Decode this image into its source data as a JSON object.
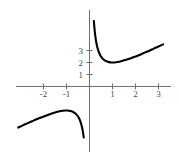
{
  "chart_data": {
    "type": "line",
    "title": "",
    "subtitle": "",
    "xlabel": "",
    "ylabel": "",
    "xlim": [
      -3.3,
      3.4
    ],
    "ylim": [
      -3.6,
      5.6
    ],
    "grid": false,
    "legend": null,
    "function": "y = x + 1/x",
    "x_ticks": [
      -2,
      -1,
      1,
      2,
      3
    ],
    "x_tick_labels": [
      "-2",
      "-1",
      "1",
      "2",
      "3"
    ],
    "y_ticks": [
      1,
      2,
      3
    ],
    "y_tick_labels": [
      "1",
      "2",
      "3"
    ],
    "annotations": [],
    "series": [
      {
        "name": "right-branch",
        "comment": "x > 0 branch, vertical asymptote at x=0, minimum at (1,2)",
        "x": [
          0.19,
          0.21,
          0.24,
          0.27,
          0.3,
          0.34,
          0.38,
          0.43,
          0.48,
          0.54,
          0.6,
          0.68,
          0.76,
          0.85,
          0.95,
          1.05,
          1.15,
          1.3,
          1.45,
          1.6,
          1.8,
          2.0,
          2.2,
          2.4,
          2.6,
          2.8,
          3.0,
          3.2
        ],
        "y": [
          5.45,
          4.97,
          4.41,
          3.97,
          3.63,
          3.28,
          3.01,
          2.76,
          2.56,
          2.39,
          2.27,
          2.15,
          2.08,
          2.03,
          2.0,
          2.0,
          2.02,
          2.07,
          2.14,
          2.23,
          2.36,
          2.5,
          2.65,
          2.82,
          2.98,
          3.16,
          3.33,
          3.51
        ]
      },
      {
        "name": "left-branch",
        "comment": "x < 0 branch, vertical asymptote at x=0, maximum at (-1,-2)",
        "x": [
          -3.1,
          -2.9,
          -2.7,
          -2.5,
          -2.3,
          -2.1,
          -1.9,
          -1.7,
          -1.5,
          -1.3,
          -1.15,
          -1.05,
          -0.95,
          -0.85,
          -0.75,
          -0.65,
          -0.58,
          -0.5,
          -0.44,
          -0.39,
          -0.35,
          -0.32,
          -0.29,
          -0.27,
          -0.25
        ],
        "y": [
          -3.42,
          -3.24,
          -3.07,
          -2.9,
          -2.73,
          -2.58,
          -2.43,
          -2.29,
          -2.17,
          -2.07,
          -2.02,
          -2.0,
          -2.0,
          -2.03,
          -2.08,
          -2.19,
          -2.3,
          -2.5,
          -2.71,
          -2.95,
          -3.21,
          -3.44,
          -3.74,
          -3.97,
          -4.25
        ]
      }
    ],
    "style": {
      "curve_color": "#000000",
      "axis_color": "#6f6f6f",
      "tick_label_color": "#4a4a4a",
      "background": "#ffffff",
      "curve_width": 2.1,
      "axis_width": 1.0
    }
  },
  "axes": {
    "x_axis_name": "x-axis",
    "y_axis_name": "y-axis",
    "origin_label": ""
  }
}
